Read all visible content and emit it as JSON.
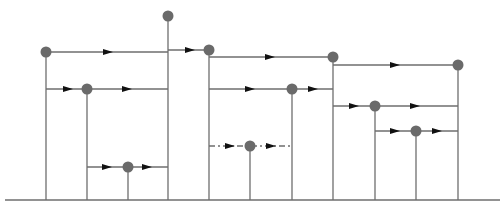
{
  "diagram": {
    "type": "tree-structure",
    "colors": {
      "line": "#6e6e6e",
      "node": "#6a6a6a",
      "arrow": "#111111",
      "background": "#ffffff"
    },
    "ground": {
      "x1": 5,
      "x2": 500,
      "y": 200
    },
    "nodes": [
      {
        "id": "n1",
        "x": 46,
        "y": 52
      },
      {
        "id": "n2",
        "x": 87,
        "y": 89
      },
      {
        "id": "n3",
        "x": 128,
        "y": 167
      },
      {
        "id": "n4",
        "x": 168,
        "y": 16
      },
      {
        "id": "n5",
        "x": 209,
        "y": 50
      },
      {
        "id": "n6",
        "x": 250,
        "y": 146
      },
      {
        "id": "n7",
        "x": 292,
        "y": 89
      },
      {
        "id": "n8",
        "x": 333,
        "y": 57
      },
      {
        "id": "n9",
        "x": 375,
        "y": 106
      },
      {
        "id": "n10",
        "x": 416,
        "y": 131
      },
      {
        "id": "n11",
        "x": 458,
        "y": 65
      }
    ],
    "verticals": [
      {
        "x": 46,
        "y1": 52,
        "y2": 200
      },
      {
        "x": 87,
        "y1": 89,
        "y2": 200
      },
      {
        "x": 128,
        "y1": 167,
        "y2": 200
      },
      {
        "x": 168,
        "y1": 16,
        "y2": 200
      },
      {
        "x": 209,
        "y1": 50,
        "y2": 200
      },
      {
        "x": 250,
        "y1": 146,
        "y2": 200
      },
      {
        "x": 292,
        "y1": 89,
        "y2": 200
      },
      {
        "x": 333,
        "y1": 57,
        "y2": 200
      },
      {
        "x": 375,
        "y1": 106,
        "y2": 200
      },
      {
        "x": 416,
        "y1": 131,
        "y2": 200
      },
      {
        "x": 458,
        "y1": 65,
        "y2": 200
      }
    ],
    "horizontals": [
      {
        "y": 52,
        "x1": 46,
        "x2": 168,
        "dashed": false,
        "arrows": [
          108
        ]
      },
      {
        "y": 89,
        "x1": 46,
        "x2": 168,
        "dashed": false,
        "arrows": [
          68,
          127
        ]
      },
      {
        "y": 167,
        "x1": 87,
        "x2": 168,
        "dashed": false,
        "arrows": [
          107,
          147
        ]
      },
      {
        "y": 50,
        "x1": 168,
        "x2": 209,
        "dashed": false,
        "arrows": [
          190
        ]
      },
      {
        "y": 57,
        "x1": 209,
        "x2": 333,
        "dashed": false,
        "arrows": [
          270
        ]
      },
      {
        "y": 89,
        "x1": 209,
        "x2": 333,
        "dashed": false,
        "arrows": [
          250,
          313
        ]
      },
      {
        "y": 146,
        "x1": 209,
        "x2": 292,
        "dashed": true,
        "arrows": [
          230,
          271
        ]
      },
      {
        "y": 65,
        "x1": 333,
        "x2": 458,
        "dashed": false,
        "arrows": [
          395
        ]
      },
      {
        "y": 106,
        "x1": 333,
        "x2": 458,
        "dashed": false,
        "arrows": [
          354,
          415
        ]
      },
      {
        "y": 131,
        "x1": 375,
        "x2": 458,
        "dashed": false,
        "arrows": [
          395,
          437
        ]
      }
    ],
    "node_radius": 5.5
  }
}
